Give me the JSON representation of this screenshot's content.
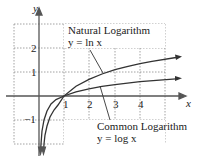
{
  "axes": {
    "x_label": "x",
    "y_label": "y",
    "x_ticks": [
      "1",
      "2",
      "3",
      "4"
    ],
    "y_ticks": [
      "2",
      "1",
      "−1"
    ]
  },
  "curves": {
    "natural": {
      "title": "Natural Logarithm",
      "equation": "y = ln x"
    },
    "common": {
      "title": "Common Logarithm",
      "equation": "y = log x"
    }
  },
  "colors": {
    "curve": "#333333",
    "grid": "#888888",
    "axis": "#555555"
  }
}
